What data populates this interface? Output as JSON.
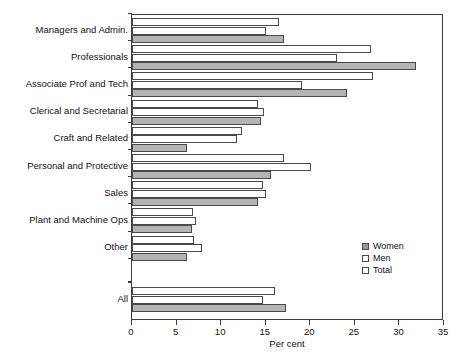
{
  "chart_data": {
    "type": "bar",
    "orientation": "horizontal",
    "title": "",
    "xlabel": "Per cent",
    "ylabel": "",
    "xlim": [
      0,
      35
    ],
    "xticks": [
      0,
      5,
      10,
      15,
      20,
      25,
      30,
      35
    ],
    "grid": false,
    "legend_position": "inside-lower-right",
    "categories": [
      "Managers and Admin.",
      "Professionals",
      "Associate Prof and Tech",
      "Clerical and Secretarial",
      "Craft and Related",
      "Personal and Protective",
      "Sales",
      "Plant and Machine Ops",
      "Other",
      "All"
    ],
    "series": [
      {
        "name": "Total",
        "color": "#ffffff",
        "values": [
          16.5,
          26.8,
          27.0,
          14.1,
          12.3,
          17.1,
          14.7,
          6.8,
          7.0,
          16.0
        ]
      },
      {
        "name": "Men",
        "color": "#ffffff",
        "values": [
          15.0,
          23.0,
          19.1,
          14.8,
          11.8,
          20.1,
          15.0,
          7.2,
          7.8,
          14.7
        ]
      },
      {
        "name": "Women",
        "color": "#b4b4b4",
        "values": [
          17.1,
          31.9,
          24.1,
          14.5,
          6.2,
          15.6,
          14.1,
          6.7,
          6.2,
          17.3
        ]
      }
    ]
  },
  "legend": {
    "items": [
      {
        "label": "Women",
        "swatch": "women"
      },
      {
        "label": "Men",
        "swatch": "men"
      },
      {
        "label": "Total",
        "swatch": "total"
      }
    ]
  },
  "axis": {
    "x_title": "Per cent",
    "tick_labels": [
      "0",
      "5",
      "10",
      "15",
      "20",
      "25",
      "30",
      "35"
    ]
  }
}
